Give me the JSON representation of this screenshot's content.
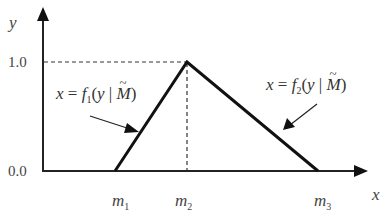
{
  "diagram": {
    "type": "triangular-membership-function",
    "axes": {
      "x_label": "x",
      "y_label": "y",
      "y_ticks": [
        "1.0",
        "0.0"
      ]
    },
    "x_markers": [
      {
        "base": "m",
        "sub": "1"
      },
      {
        "base": "m",
        "sub": "2"
      },
      {
        "base": "m",
        "sub": "3"
      }
    ],
    "formulas": {
      "left": {
        "lhs": "x",
        "eq": " = ",
        "func": "f",
        "sub": "1",
        "open": "(",
        "var": "y",
        "bar": " | ",
        "param": "M",
        "close": ")"
      },
      "right": {
        "lhs": "x",
        "eq": " = ",
        "func": "f",
        "sub": "2",
        "open": "(",
        "var": "y",
        "bar": " | ",
        "param": "M",
        "close": ")"
      }
    },
    "colors": {
      "line": "#111111",
      "text": "#444444"
    }
  }
}
